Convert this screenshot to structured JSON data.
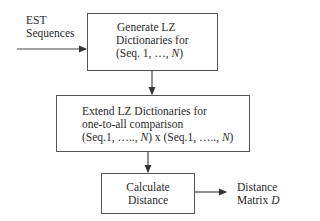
{
  "diagram": {
    "type": "flowchart",
    "input_label": {
      "line1": "EST",
      "line2": "Sequences"
    },
    "boxes": [
      {
        "id": "generate",
        "lines": [
          "Generate LZ",
          "Dictionaries for",
          "(Seq. 1, …, "
        ],
        "italic_tail": "N",
        "tail_close": ")"
      },
      {
        "id": "extend",
        "lines": [
          "Extend LZ Dictionaries for",
          "one-to-all comparison"
        ],
        "line3_parts": [
          "(Seq.1, ….., ",
          "N",
          ") x (Seq.1, ….., ",
          "N",
          ")"
        ]
      },
      {
        "id": "calculate",
        "lines": [
          "Calculate",
          "Distance"
        ]
      }
    ],
    "output_label": {
      "line1": "Distance",
      "line2_prefix": "Matrix ",
      "line2_var": "D"
    },
    "edges": [
      {
        "from": "input",
        "to": "generate"
      },
      {
        "from": "generate",
        "to": "extend"
      },
      {
        "from": "extend",
        "to": "calculate"
      },
      {
        "from": "calculate",
        "to": "output"
      }
    ],
    "colors": {
      "stroke": "#555555",
      "text": "#2a2a2a",
      "background": "#ffffff"
    }
  }
}
